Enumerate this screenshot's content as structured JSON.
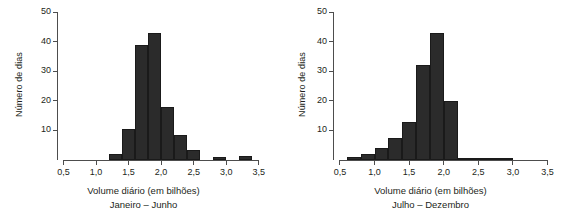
{
  "figure": {
    "panel_count": 2,
    "bar_color": "#2b2b2b",
    "axis_color": "#4d4d4d",
    "background": "#ffffff"
  },
  "panels": [
    {
      "id": "janeiro-junho",
      "ylabel": "Número de dias",
      "xlabel": "Volume diário (em bilhões)",
      "caption": "Janeiro – Junho",
      "yticks": [
        "10",
        "20",
        "30",
        "40",
        "50"
      ],
      "xticks": [
        "0,5",
        "1,0",
        "1,5",
        "2,0",
        "2,5",
        "3,0",
        "3,5"
      ]
    },
    {
      "id": "julho-dezembro",
      "ylabel": "Número de dias",
      "xlabel": "Volume diário (em bilhões)",
      "caption": "Julho – Dezembro",
      "yticks": [
        "10",
        "20",
        "30",
        "40",
        "50"
      ],
      "xticks": [
        "0,5",
        "1,0",
        "1,5",
        "2,0",
        "2,5",
        "3,0",
        "3,5"
      ]
    }
  ],
  "chart_data": [
    {
      "type": "bar",
      "title": "Janeiro – Junho",
      "xlabel": "Volume diário (em bilhões)",
      "ylabel": "Número de dias",
      "xlim": [
        0.4,
        3.55
      ],
      "ylim": [
        0,
        50
      ],
      "xticks": [
        0.5,
        1.0,
        1.5,
        2.0,
        2.5,
        3.0,
        3.5
      ],
      "xtick_labels": [
        "0,5",
        "1,0",
        "1,5",
        "2,0",
        "2,5",
        "3,0",
        "3,5"
      ],
      "yticks": [
        10,
        20,
        30,
        40,
        50
      ],
      "ytick_labels": [
        "10",
        "20",
        "30",
        "40",
        "50"
      ],
      "grid": false,
      "legend": null,
      "bin_width": 0.2,
      "bin_edges": [
        1.2,
        1.4,
        1.6,
        1.8,
        2.0,
        2.2,
        2.4,
        2.6,
        2.8,
        3.0,
        3.2,
        3.4
      ],
      "categories": [
        "1,2–1,4",
        "1,4–1,6",
        "1,6–1,8",
        "1,8–2,0",
        "2,0–2,2",
        "2,2–2,4",
        "2,4–2,6",
        "2,6–2,8",
        "2,8–3,0",
        "3,0–3,2",
        "3,2–3,4"
      ],
      "values": [
        2,
        10.5,
        39,
        43,
        18,
        8.5,
        3.5,
        0,
        1,
        0,
        1.5
      ]
    },
    {
      "type": "bar",
      "title": "Julho – Dezembro",
      "xlabel": "Volume diário (em bilhões)",
      "ylabel": "Número de dias",
      "xlim": [
        0.4,
        3.55
      ],
      "ylim": [
        0,
        50
      ],
      "xticks": [
        0.5,
        1.0,
        1.5,
        2.0,
        2.5,
        3.0,
        3.5
      ],
      "xtick_labels": [
        "0,5",
        "1,0",
        "1,5",
        "2,0",
        "2,5",
        "3,0",
        "3,5"
      ],
      "yticks": [
        10,
        20,
        30,
        40,
        50
      ],
      "ytick_labels": [
        "10",
        "20",
        "30",
        "40",
        "50"
      ],
      "grid": false,
      "legend": null,
      "bin_width": 0.2,
      "bin_edges": [
        0.6,
        0.8,
        1.0,
        1.2,
        1.4,
        1.6,
        1.8,
        2.0,
        2.2,
        2.4,
        2.6,
        2.8,
        3.0
      ],
      "categories": [
        "0,6–0,8",
        "0,8–1,0",
        "1,0–1,2",
        "1,2–1,4",
        "1,4–1,6",
        "1,6–1,8",
        "1,8–2,0",
        "2,0–2,2",
        "2,2–2,4",
        "2,4–2,6",
        "2,6–2,8",
        "2,8–3,0"
      ],
      "values": [
        1,
        2,
        4,
        7.5,
        13,
        32,
        43,
        20,
        0.8,
        0.8,
        0.8,
        0.8
      ]
    }
  ]
}
